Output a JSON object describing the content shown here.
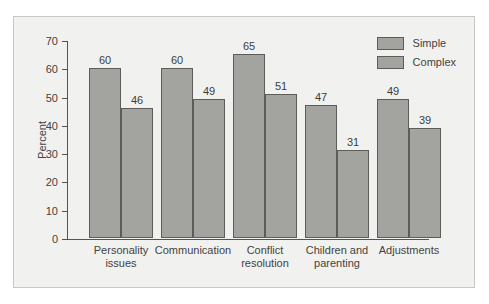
{
  "chart_data": {
    "type": "bar",
    "title": "",
    "xlabel": "",
    "ylabel": "Percent",
    "ylim": [
      0,
      70
    ],
    "yticks": [
      0,
      10,
      20,
      30,
      40,
      50,
      60,
      70
    ],
    "grid": false,
    "legend_position": "top-right",
    "categories": [
      "Personality issues",
      "Communication",
      "Conflict resolution",
      "Children and parenting",
      "Adjustments"
    ],
    "category_lines": [
      [
        "Personality",
        "issues"
      ],
      [
        "Communication",
        ""
      ],
      [
        "Conflict",
        "resolution"
      ],
      [
        "Children and",
        "parenting"
      ],
      [
        "Adjustments",
        ""
      ]
    ],
    "series": [
      {
        "name": "Simple",
        "values": [
          60,
          60,
          65,
          47,
          49
        ]
      },
      {
        "name": "Complex",
        "values": [
          46,
          49,
          51,
          31,
          39
        ]
      }
    ],
    "colors": {
      "bar_fill": "#a3a3a0",
      "bar_stroke": "#5d5c59",
      "axis": "#555451",
      "text": "#444340",
      "plot_background": "#f1f1ef",
      "frame_border": "#c8c8c4"
    }
  },
  "legend": {
    "items": [
      {
        "label": "Simple"
      },
      {
        "label": "Complex"
      }
    ]
  }
}
